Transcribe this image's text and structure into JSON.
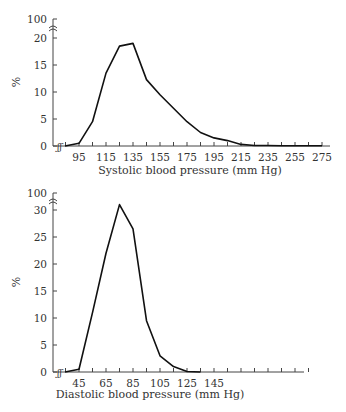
{
  "chart_data": [
    {
      "type": "line",
      "title": "",
      "xlabel": "Systolic blood pressure (mm Hg)",
      "ylabel": "%",
      "x_tick_labels": [
        "95",
        "115",
        "135",
        "155",
        "175",
        "195",
        "215",
        "235",
        "255",
        "275"
      ],
      "y_tick_labels": [
        "0",
        "5",
        "10",
        "15",
        "20",
        "100"
      ],
      "y_axis_break": "between 20 and 100",
      "x_axis_break": "near origin",
      "ylim": [
        0,
        20
      ],
      "grid": false,
      "legend": null,
      "x": [
        85,
        95,
        105,
        115,
        125,
        135,
        145,
        155,
        165,
        175,
        185,
        195,
        205,
        215,
        225,
        235,
        245,
        255,
        265,
        275
      ],
      "values": [
        0,
        0.5,
        4.5,
        13.5,
        18.5,
        19,
        12.3,
        9.5,
        7,
        4.5,
        2.5,
        1.5,
        1,
        0.3,
        0.1,
        0.1,
        0.05,
        0.05,
        0.05,
        0.05
      ]
    },
    {
      "type": "line",
      "title": "",
      "xlabel": "Diastolic blood pressure (mm Hg)",
      "ylabel": "%",
      "x_tick_labels": [
        "45",
        "65",
        "85",
        "105",
        "125",
        "145"
      ],
      "y_tick_labels": [
        "0",
        "5",
        "10",
        "15",
        "20",
        "25",
        "30",
        "100"
      ],
      "y_axis_break": "between 30 and 100",
      "x_axis_break": "near origin",
      "ylim": [
        0,
        30
      ],
      "grid": false,
      "legend": null,
      "x": [
        35,
        45,
        55,
        65,
        75,
        85,
        95,
        105,
        115,
        125,
        135
      ],
      "values": [
        0,
        0.5,
        11,
        22,
        31,
        26.5,
        9.5,
        3,
        1,
        0.1,
        0
      ]
    }
  ],
  "charts": {
    "systolic": {
      "xlabel": "Systolic blood pressure (mm Hg)",
      "ylabel": "%",
      "y_ticks": [
        "0",
        "5",
        "10",
        "15",
        "20",
        "100"
      ],
      "x_ticks": [
        "95",
        "115",
        "135",
        "155",
        "175",
        "195",
        "215",
        "235",
        "255",
        "275"
      ]
    },
    "diastolic": {
      "xlabel": "Diastolic blood pressure (mm Hg)",
      "ylabel": "%",
      "y_ticks": [
        "0",
        "5",
        "10",
        "15",
        "20",
        "25",
        "30",
        "100"
      ],
      "x_ticks": [
        "45",
        "65",
        "85",
        "105",
        "125",
        "145"
      ]
    }
  },
  "colors": {
    "line": "#111111",
    "axis": "#444444",
    "text": "#333333"
  }
}
